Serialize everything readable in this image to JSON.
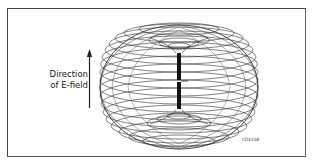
{
  "figure": {
    "label_line1": "Direction",
    "label_line2": "of E-field",
    "figure_code": "CD1158",
    "arrow_direction": "up"
  },
  "colors": {
    "line": "#333333",
    "frame": "#444444",
    "background": "#ffffff"
  }
}
